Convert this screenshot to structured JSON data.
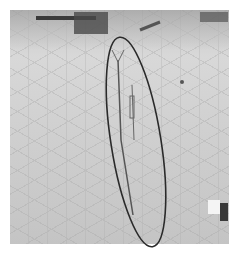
{
  "image": {
    "description": "Grayscale photograph of a tiled pavement with debris at top, a thin upright object, highlighted by a hand-drawn elliptical outline",
    "annotation": {
      "shape": "ellipse",
      "color": "#2a2a2a"
    },
    "colors": {
      "background": "#ffffff",
      "pavement": "#cfcfcf",
      "debris": "#3a3a3a"
    }
  }
}
